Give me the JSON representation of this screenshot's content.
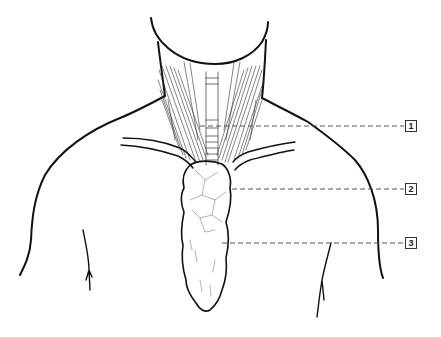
{
  "diagram": {
    "colors": {
      "line": "#111111",
      "dash": "#555555",
      "background": "#ffffff"
    },
    "labels": [
      {
        "id": 1,
        "text": "1",
        "y": 126,
        "line_start_x": 200
      },
      {
        "id": 2,
        "text": "2",
        "y": 189,
        "line_start_x": 232
      },
      {
        "id": 3,
        "text": "3",
        "y": 243,
        "line_start_x": 222
      }
    ]
  }
}
